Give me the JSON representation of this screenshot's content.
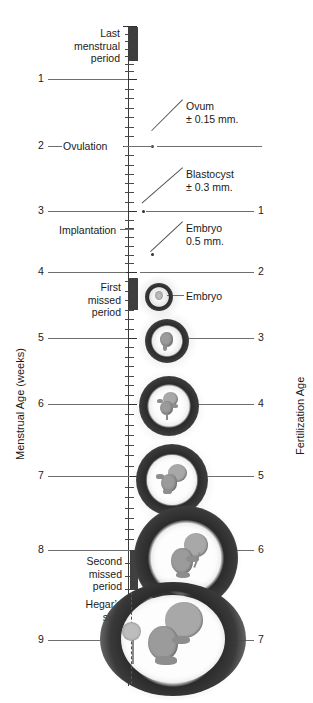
{
  "figure": {
    "type": "timeline-diagram"
  },
  "axes": {
    "left_title": "Menstrual Age (weeks)",
    "right_title": "Fertilization Age",
    "left_ticks": [
      "1",
      "2",
      "3",
      "4",
      "5",
      "6",
      "7",
      "8",
      "9"
    ],
    "right_ticks": [
      "1",
      "2",
      "3",
      "4",
      "5",
      "6",
      "7"
    ]
  },
  "events": {
    "last_menstrual_period": "Last\nmenstrual\nperiod",
    "ovulation": "Ovulation",
    "implantation": "Implantation",
    "first_missed_period": "First\nmissed\nperiod",
    "second_missed_period": "Second\nmissed\nperiod",
    "hegars_sign": "Hegar’s\nsign"
  },
  "callouts": [
    {
      "name": "ovum",
      "line1": "Ovum",
      "line2": "± 0.15 mm."
    },
    {
      "name": "blastocyst",
      "line1": "Blastocyst",
      "line2": "± 0.3 mm."
    },
    {
      "name": "embryo_05",
      "line1": "Embryo",
      "line2": "0.5 mm."
    },
    {
      "name": "embryo_sac",
      "line1": "Embryo",
      "line2": ""
    }
  ],
  "chart_data": {
    "type": "line",
    "xlabel": "",
    "ylabel": "Menstrual Age (weeks)",
    "series": [
      {
        "name": "Menstrual Age (weeks)",
        "values": [
          1,
          2,
          3,
          4,
          5,
          6,
          7,
          8,
          9
        ]
      },
      {
        "name": "Fertilization Age",
        "values": [
          1,
          2,
          3,
          4,
          5,
          6,
          7
        ]
      }
    ],
    "annotations": [
      {
        "label": "Last menstrual period",
        "menstrual_week": 0
      },
      {
        "label": "Ovulation",
        "menstrual_week": 2,
        "fertilization_week": 0
      },
      {
        "label": "Ovum ± 0.15 mm.",
        "menstrual_week": 2
      },
      {
        "label": "Blastocyst ± 0.3 mm.",
        "menstrual_week": 3,
        "fertilization_week": 1
      },
      {
        "label": "Implantation",
        "menstrual_week": 3.4
      },
      {
        "label": "Embryo 0.5 mm.",
        "menstrual_week": 3.7
      },
      {
        "label": "First missed period",
        "menstrual_week": 4,
        "fertilization_week": 2
      },
      {
        "label": "Embryo",
        "menstrual_week": 4.2
      },
      {
        "label": "Second missed period",
        "menstrual_week": 8,
        "fertilization_week": 6
      },
      {
        "label": "Hegar's sign",
        "menstrual_week": 8.6
      }
    ]
  }
}
